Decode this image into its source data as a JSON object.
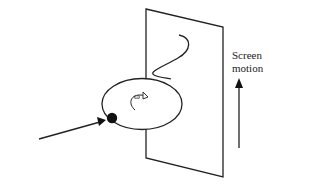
{
  "diagram": {
    "labels": {
      "screen_line1": "Screen",
      "screen_line2": "motion",
      "omega": "ω"
    },
    "colors": {
      "stroke": "#222222",
      "background": "#ffffff"
    },
    "elements": [
      "vertical screen plane",
      "wave trace on screen",
      "rotating elliptical disk",
      "rotation arrow with omega",
      "ball on disk edge",
      "incoming arrow",
      "upward screen motion arrow"
    ]
  }
}
